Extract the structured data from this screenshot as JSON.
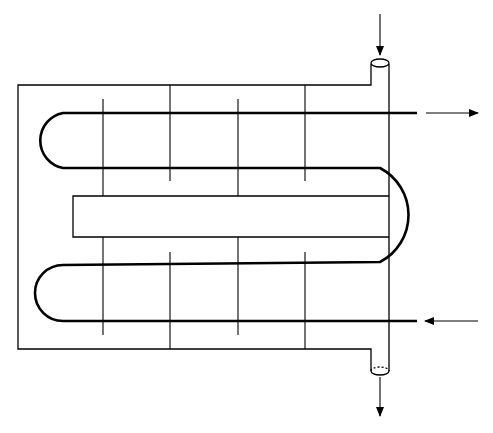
{
  "diagram": {
    "colors": {
      "stroke": "#000000",
      "background": "#ffffff"
    },
    "shell": {
      "shape": "C-shaped shell with inner rectangular cutout",
      "inlet_nozzle": "top-right",
      "outlet_nozzle": "bottom-right"
    },
    "tube": {
      "passes": 4,
      "inlet_side": "bottom-right",
      "outlet_side": "top-right"
    },
    "baffles": {
      "count_per_half": 4
    },
    "arrows": [
      {
        "name": "shell-inlet-arrow",
        "direction": "down"
      },
      {
        "name": "tube-outlet-arrow",
        "direction": "right"
      },
      {
        "name": "tube-inlet-arrow",
        "direction": "left"
      },
      {
        "name": "shell-outlet-arrow",
        "direction": "down"
      }
    ]
  }
}
